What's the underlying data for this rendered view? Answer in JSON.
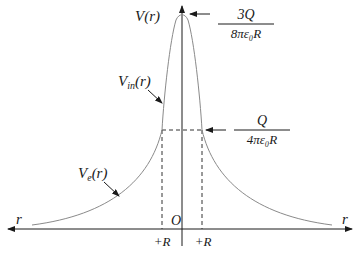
{
  "diagram": {
    "type": "potential_vs_distance",
    "axes": {
      "y_label": "V(r)",
      "x_label_right": "r",
      "x_label_left": "r",
      "origin_label": "O"
    },
    "markers": {
      "left_radius": "+R",
      "right_radius": "+R"
    },
    "annotations": {
      "peak": {
        "numerator": "3Q",
        "denominator": "8πε₀R"
      },
      "surface": {
        "numerator": "Q",
        "denominator": "4πε₀R"
      },
      "inside_curve": {
        "main": "V",
        "sub": "in",
        "arg": "(r)"
      },
      "outside_curve": {
        "main": "V",
        "sub": "e",
        "arg": "(r)"
      }
    },
    "colors": {
      "curve": "#8a8a8a",
      "axes": "#1a1a1a",
      "dashed": "#333333"
    }
  }
}
